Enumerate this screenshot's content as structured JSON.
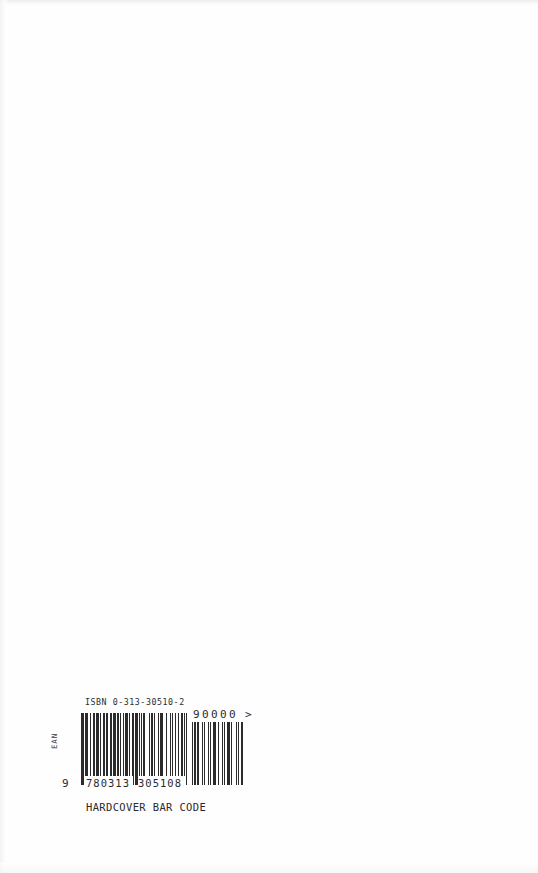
{
  "page": {
    "kind": "book-back-cover-scan",
    "background_color": "#ffffff",
    "ink_color": "#2b2b2b"
  },
  "barcode": {
    "isbn_label": "ISBN 0-313-30510-2",
    "symbology_label": "EAN",
    "lead_digit": "9",
    "digits_left": "780313",
    "digits_right": "305108",
    "full_number": "9780313305108",
    "caption": "HARDCOVER BAR CODE",
    "addon": {
      "value": "90000",
      "terminator": ">",
      "digit_count": 5
    },
    "main_modules": [
      1,
      1,
      1,
      0,
      1,
      0,
      1,
      1,
      0,
      0,
      1,
      0,
      0,
      1,
      1,
      0,
      1,
      1,
      1,
      1,
      0,
      1,
      0,
      0,
      1,
      1,
      1,
      0,
      1,
      1,
      0,
      0,
      1,
      1,
      0,
      1,
      1,
      1,
      1,
      0,
      1,
      1,
      0,
      1,
      0,
      0,
      1,
      0,
      1,
      1,
      1,
      1,
      0,
      1,
      0,
      0,
      1,
      1,
      0,
      1,
      1,
      1,
      1,
      0,
      1,
      0,
      1,
      0,
      1,
      0,
      1,
      0,
      0,
      0,
      0,
      1,
      0,
      1,
      1,
      0,
      0,
      1,
      0,
      0,
      0,
      1,
      0,
      1,
      1,
      1,
      0,
      1,
      0,
      0,
      1,
      0,
      0,
      0,
      1,
      0,
      1,
      0,
      0,
      0,
      1,
      0,
      0,
      1,
      0,
      0,
      1,
      1,
      1,
      0,
      1,
      0,
      1,
      0,
      1,
      0
    ],
    "addon_modules": [
      1,
      0,
      1,
      1,
      0,
      1,
      1,
      0,
      0,
      1,
      0,
      1,
      0,
      0,
      0,
      1,
      0,
      1,
      0,
      0,
      1,
      1,
      1,
      0,
      1,
      0,
      0,
      0,
      1,
      0,
      1,
      0,
      0,
      1,
      1,
      1,
      0,
      1,
      0,
      0,
      0,
      1,
      0,
      1,
      0,
      0,
      1,
      1
    ]
  }
}
